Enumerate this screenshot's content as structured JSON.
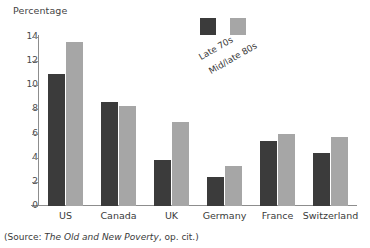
{
  "chart_data": {
    "type": "bar",
    "title": "",
    "ylabel": "Percentage",
    "xlabel": "",
    "ylim": [
      0,
      14
    ],
    "yticks": [
      0,
      2,
      4,
      6,
      8,
      10,
      12,
      14
    ],
    "grid": false,
    "legend_position": "top-center",
    "categories": [
      "US",
      "Canada",
      "UK",
      "Germany",
      "France",
      "Switzerland"
    ],
    "series": [
      {
        "name": "Late 70s",
        "color": "#3b3b3b",
        "values": [
          10.9,
          8.6,
          3.8,
          2.4,
          5.4,
          4.4
        ]
      },
      {
        "name": "Mid/late 80s",
        "color": "#a6a6a6",
        "values": [
          13.6,
          8.3,
          7.0,
          3.3,
          6.0,
          5.7
        ]
      }
    ]
  },
  "axis_title": "Percentage",
  "source": {
    "prefix": "(Source: ",
    "title": "The Old and New Poverty",
    "suffix": ", op. cit.)"
  }
}
